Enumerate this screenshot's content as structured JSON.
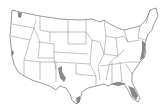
{
  "map": {
    "title": "Continental United States",
    "style": "outline map with state boundaries",
    "background": "#ffffff",
    "stroke_color": "#555555",
    "highlight_color": "#888888",
    "highlighted_regions": [
      "Florida coast",
      "Gulf coast",
      "Southwest Texas / New Mexico",
      "Mid-Atlantic coast",
      "Washington coast",
      "California coast"
    ]
  }
}
